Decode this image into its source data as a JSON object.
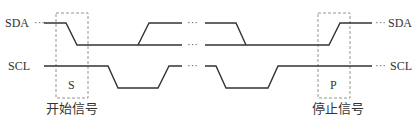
{
  "diagram": {
    "signals": [
      {
        "name": "SDA",
        "left_label": "SDA",
        "right_label": "SDA"
      },
      {
        "name": "SCL",
        "left_label": "SCL",
        "right_label": "SCL"
      }
    ],
    "continuation": "···",
    "gap": "···",
    "start_box": {
      "marker": "S",
      "caption": "开始信号"
    },
    "stop_box": {
      "marker": "P",
      "caption": "停止信号"
    },
    "colors": {
      "line": "#333333",
      "box": "#888888"
    }
  }
}
